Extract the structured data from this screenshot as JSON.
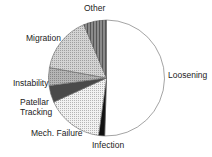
{
  "chart_data": {
    "type": "pie",
    "title": "",
    "start_angle_deg": 0,
    "direction": "clockwise",
    "slices": [
      {
        "label": "Loosening",
        "value": 50.5,
        "fill": "#ffffff",
        "pattern": "none"
      },
      {
        "label": "Infection",
        "value": 1.7,
        "fill": "#111111",
        "pattern": "none"
      },
      {
        "label": "Mech. Failure",
        "value": 16.0,
        "fill": "#f2f2f2",
        "pattern": "dots"
      },
      {
        "label": "Patellar Tracking",
        "value": 4.7,
        "fill": "#4a4a4a",
        "pattern": "none"
      },
      {
        "label": "Instability",
        "value": 5.0,
        "fill": "#b5b5b5",
        "pattern": "dots"
      },
      {
        "label": "Migration",
        "value": 15.7,
        "fill": "#d4d4d4",
        "pattern": "dots"
      },
      {
        "label": "Other",
        "value": 6.4,
        "fill": "#8a8a8a",
        "pattern": "vertical-lines"
      }
    ],
    "labels": {
      "loosening": "Loosening",
      "infection": "Infection",
      "mech_failure": "Mech. Failure",
      "patellar_1": "Patellar",
      "patellar_2": "Tracking",
      "instability": "Instability",
      "migration": "Migration",
      "other": "Other"
    }
  }
}
